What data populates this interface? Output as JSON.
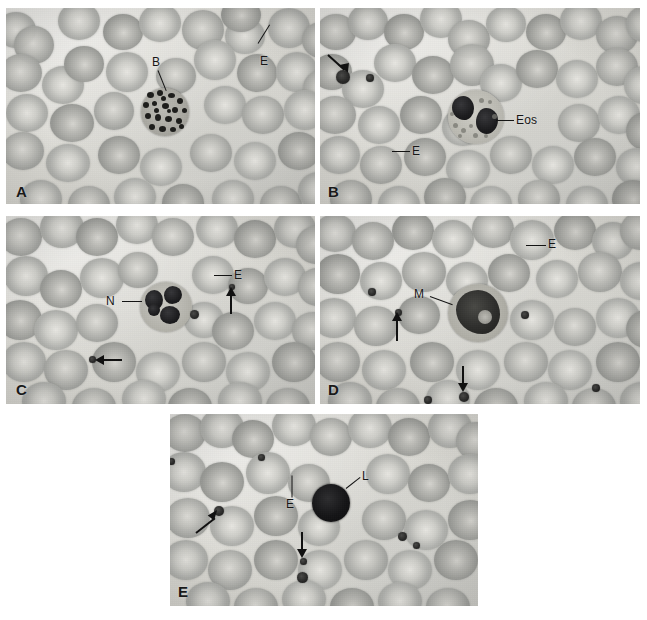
{
  "figure": {
    "background_color": "#ffffff",
    "panel_count": 5,
    "legend_keys": {
      "E": "erythrocyte",
      "B": "basophil",
      "Eos": "eosinophil",
      "N": "neutrophil",
      "M": "monocyte",
      "L": "lymphocyte",
      "arrow": "platelet"
    }
  },
  "panels": [
    {
      "id": "A",
      "letter": "A",
      "cell_type": "basophil",
      "labels": [
        {
          "text": "B",
          "target": "basophil"
        },
        {
          "text": "E",
          "target": "erythrocyte"
        }
      ],
      "arrows": 0
    },
    {
      "id": "B",
      "letter": "B",
      "cell_type": "eosinophil",
      "labels": [
        {
          "text": "Eos",
          "target": "eosinophil"
        },
        {
          "text": "E",
          "target": "erythrocyte"
        }
      ],
      "arrows": 1
    },
    {
      "id": "C",
      "letter": "C",
      "cell_type": "neutrophil",
      "labels": [
        {
          "text": "N",
          "target": "neutrophil"
        },
        {
          "text": "E",
          "target": "erythrocyte"
        }
      ],
      "arrows": 2
    },
    {
      "id": "D",
      "letter": "D",
      "cell_type": "monocyte",
      "labels": [
        {
          "text": "M",
          "target": "monocyte"
        },
        {
          "text": "E",
          "target": "erythrocyte"
        }
      ],
      "arrows": 2
    },
    {
      "id": "E",
      "letter": "E",
      "cell_type": "lymphocyte",
      "labels": [
        {
          "text": "L",
          "target": "lymphocyte"
        },
        {
          "text": "E",
          "target": "erythrocyte"
        }
      ],
      "arrows": 2
    }
  ]
}
